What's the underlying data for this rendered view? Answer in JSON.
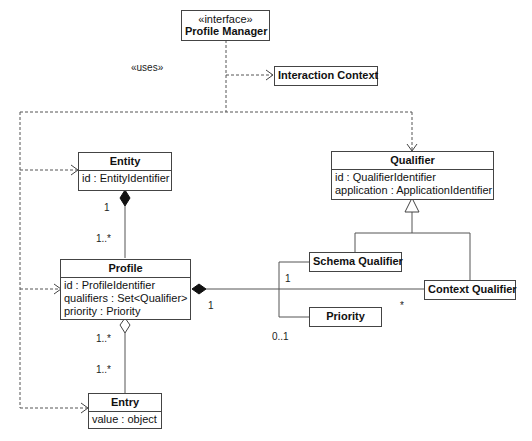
{
  "diagram": {
    "type": "uml-class-diagram",
    "classes": {
      "profile_manager": {
        "stereotype": "«interface»",
        "name": "Profile Manager"
      },
      "interaction_context": {
        "name": "Interaction Context"
      },
      "entity": {
        "name": "Entity",
        "attributes": [
          "id : EntityIdentifier"
        ]
      },
      "qualifier": {
        "name": "Qualifier",
        "attributes": [
          "id : QualifierIdentifier",
          "application : ApplicationIdentifier"
        ]
      },
      "profile": {
        "name": "Profile",
        "attributes": [
          "id : ProfileIdentifier",
          "qualifiers : Set<Qualifier>",
          "priority : Priority"
        ]
      },
      "schema_qualifier": {
        "name": "Schema Qualifier"
      },
      "context_qualifier": {
        "name": "Context Qualifier"
      },
      "priority": {
        "name": "Priority"
      },
      "entry": {
        "name": "Entry",
        "attributes": [
          "value : object"
        ]
      }
    },
    "labels": {
      "uses": "«uses»",
      "entity_profile_entity_mult": "1",
      "entity_profile_profile_mult": "1..*",
      "profile_entry_profile_mult": "1..*",
      "profile_entry_entry_mult": "1..*",
      "profile_context_profile_mult": "1",
      "profile_context_context_mult": "*",
      "schema_priority_schema_mult": "1",
      "schema_priority_priority_mult": "0..1"
    },
    "relationships": [
      {
        "from": "Profile Manager",
        "to": "Interaction Context",
        "kind": "dependency",
        "label": "«uses»"
      },
      {
        "from": "Profile Manager",
        "to": "Entity",
        "kind": "dependency"
      },
      {
        "from": "Profile Manager",
        "to": "Profile",
        "kind": "dependency"
      },
      {
        "from": "Profile Manager",
        "to": "Entry",
        "kind": "dependency"
      },
      {
        "from": "Profile Manager",
        "to": "Qualifier",
        "kind": "dependency"
      },
      {
        "from": "Entity",
        "to": "Profile",
        "kind": "composition",
        "mult_from": "1",
        "mult_to": "1..*"
      },
      {
        "from": "Profile",
        "to": "Entry",
        "kind": "aggregation",
        "mult_from": "1..*",
        "mult_to": "1..*"
      },
      {
        "from": "Profile",
        "to": "Context Qualifier",
        "kind": "composition",
        "mult_from": "1",
        "mult_to": "*"
      },
      {
        "from": "Schema Qualifier",
        "to": "Qualifier",
        "kind": "generalization"
      },
      {
        "from": "Context Qualifier",
        "to": "Qualifier",
        "kind": "generalization"
      },
      {
        "from": "Schema Qualifier",
        "to": "Priority",
        "kind": "association",
        "mult_from": "1",
        "mult_to": "0..1"
      }
    ]
  }
}
